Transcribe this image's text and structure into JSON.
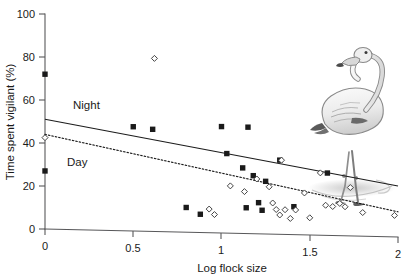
{
  "figure": {
    "background_color": "#ffffff",
    "illustration_name": "flamingo-illustration",
    "illustration_description": "Greyscale pen-and-ink drawing of a standing greater flamingo with its shadow/reflection"
  },
  "chart_data": {
    "type": "scatter",
    "title": "",
    "xlabel": "Log flock size",
    "ylabel": "Time spent vigilant (%)",
    "xlim": [
      0,
      2
    ],
    "ylim": [
      0,
      100
    ],
    "xticks": [
      0,
      0.5,
      1,
      1.5,
      2
    ],
    "xtick_labels": [
      "0",
      "0.5",
      "1",
      "1.5",
      "2"
    ],
    "yticks": [
      0,
      20,
      40,
      60,
      80,
      100
    ],
    "ytick_labels": [
      "0",
      "20",
      "40",
      "60",
      "80",
      "100"
    ],
    "grid": false,
    "legend_position": "inline-annotation",
    "annotations": [
      {
        "text": "Night",
        "x": 0.33,
        "y": 57.5,
        "series": "Night"
      },
      {
        "text": "Day",
        "x": 0.26,
        "y": 30.5,
        "series": "Day"
      }
    ],
    "series": [
      {
        "name": "Night",
        "marker": "filled-square",
        "marker_color": "#1a1a1a",
        "line_style": "solid",
        "fit_line": {
          "x0": 0.0,
          "y0": 51.0,
          "x1": 2.0,
          "y1": 20.0
        },
        "points": [
          {
            "x": 0.0,
            "y": 72.0
          },
          {
            "x": 0.0,
            "y": 27.0
          },
          {
            "x": 0.5,
            "y": 48.5
          },
          {
            "x": 0.61,
            "y": 47.5
          },
          {
            "x": 0.8,
            "y": 11.5
          },
          {
            "x": 0.88,
            "y": 8.5
          },
          {
            "x": 1.0,
            "y": 49.5
          },
          {
            "x": 1.03,
            "y": 37.0
          },
          {
            "x": 1.12,
            "y": 30.5
          },
          {
            "x": 1.14,
            "y": 12.0
          },
          {
            "x": 1.15,
            "y": 49.5
          },
          {
            "x": 1.18,
            "y": 27.0
          },
          {
            "x": 1.21,
            "y": 14.5
          },
          {
            "x": 1.23,
            "y": 11.0
          },
          {
            "x": 1.25,
            "y": 24.5
          },
          {
            "x": 1.33,
            "y": 34.5
          },
          {
            "x": 1.41,
            "y": 13.0
          },
          {
            "x": 1.6,
            "y": 29.0
          }
        ]
      },
      {
        "name": "Day",
        "marker": "open-diamond",
        "marker_color": "#ffffff",
        "line_style": "dotted",
        "fit_line": {
          "x0": 0.0,
          "y0": 44.0,
          "x1": 2.0,
          "y1": 8.0
        },
        "points": [
          {
            "x": 0.0,
            "y": 42.5
          },
          {
            "x": 0.62,
            "y": 80.5
          },
          {
            "x": 0.93,
            "y": 11.0
          },
          {
            "x": 0.96,
            "y": 8.5
          },
          {
            "x": 1.05,
            "y": 22.0
          },
          {
            "x": 1.13,
            "y": 19.5
          },
          {
            "x": 1.2,
            "y": 25.5
          },
          {
            "x": 1.27,
            "y": 22.0
          },
          {
            "x": 1.29,
            "y": 14.5
          },
          {
            "x": 1.31,
            "y": 11.5
          },
          {
            "x": 1.33,
            "y": 9.0
          },
          {
            "x": 1.34,
            "y": 34.5
          },
          {
            "x": 1.36,
            "y": 11.5
          },
          {
            "x": 1.39,
            "y": 7.5
          },
          {
            "x": 1.42,
            "y": 11.5
          },
          {
            "x": 1.47,
            "y": 19.5
          },
          {
            "x": 1.5,
            "y": 8.0
          },
          {
            "x": 1.56,
            "y": 29.0
          },
          {
            "x": 1.59,
            "y": 14.0
          },
          {
            "x": 1.63,
            "y": 13.5
          },
          {
            "x": 1.67,
            "y": 15.0
          },
          {
            "x": 1.7,
            "y": 13.5
          },
          {
            "x": 1.73,
            "y": 22.5
          },
          {
            "x": 1.8,
            "y": 11.0
          },
          {
            "x": 1.98,
            "y": 10.0
          }
        ]
      }
    ]
  }
}
